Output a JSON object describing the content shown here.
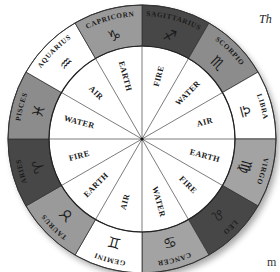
{
  "caption": {
    "top_right": "Th",
    "bottom_right": "m"
  },
  "wheel": {
    "center": [
      142,
      139
    ],
    "outer_radius": 134,
    "inner_radius": 93,
    "colors": {
      "white": "#ffffff",
      "light_gray": "#a3a3a3",
      "mid_gray": "#8c8c8c",
      "dark_gray": "#474747",
      "line": "#333333"
    },
    "signs": [
      {
        "name": "SAGITTARIUS",
        "glyph": "♐",
        "fill": "#474747",
        "element": "FIRE"
      },
      {
        "name": "SCORPIO",
        "glyph": "♏",
        "fill": "#8c8c8c",
        "element": "WATER"
      },
      {
        "name": "LIBRA",
        "glyph": "♎",
        "fill": "#ffffff",
        "element": "AIR"
      },
      {
        "name": "VIRGO",
        "glyph": "♍",
        "fill": "#a3a3a3",
        "element": "EARTH"
      },
      {
        "name": "LEO",
        "glyph": "♌",
        "fill": "#474747",
        "element": "FIRE"
      },
      {
        "name": "CANCER",
        "glyph": "♋",
        "fill": "#a3a3a3",
        "element": "WATER"
      },
      {
        "name": "GEMINI",
        "glyph": "♊",
        "fill": "#ffffff",
        "element": "AIR"
      },
      {
        "name": "TAURUS",
        "glyph": "♉",
        "fill": "#9a9a9a",
        "element": "EARTH"
      },
      {
        "name": "ARIES",
        "glyph": "♈",
        "fill": "#474747",
        "element": "FIRE"
      },
      {
        "name": "PISCES",
        "glyph": "♓",
        "fill": "#8c8c8c",
        "element": "WATER"
      },
      {
        "name": "AQUARIUS",
        "glyph": "♒",
        "fill": "#ffffff",
        "element": "AIR"
      },
      {
        "name": "CAPRICORN",
        "glyph": "♑",
        "fill": "#9a9a9a",
        "element": "EARTH"
      }
    ]
  }
}
